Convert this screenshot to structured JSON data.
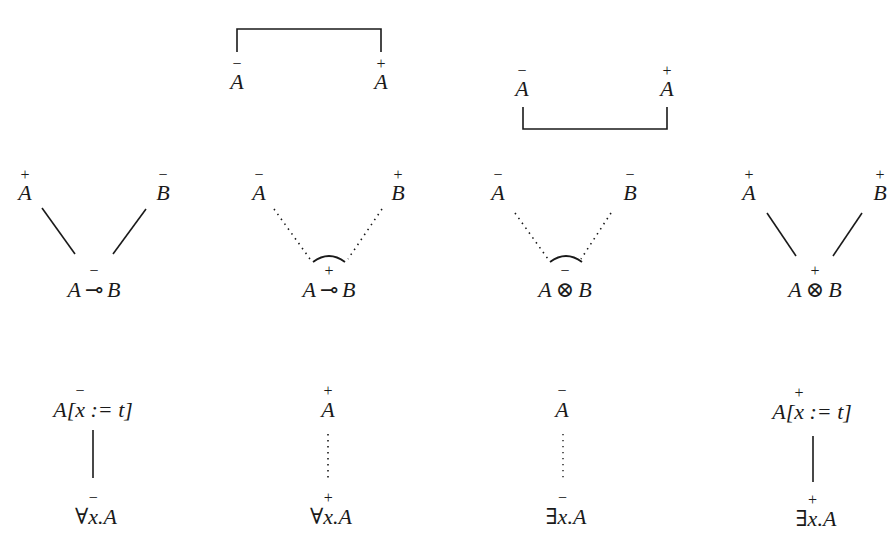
{
  "diagram": {
    "type": "proof-net-links",
    "axiom_links": [
      {
        "id": "axiom-top",
        "left": {
          "atom": "A",
          "polarity": "-"
        },
        "right": {
          "atom": "A",
          "polarity": "+"
        },
        "bracket": "above"
      },
      {
        "id": "axiom-bottom",
        "left": {
          "atom": "A",
          "polarity": "-"
        },
        "right": {
          "atom": "A",
          "polarity": "+"
        },
        "bracket": "below"
      }
    ],
    "binary_links": [
      {
        "id": "lollipop-neg",
        "premises": [
          {
            "atom": "A",
            "polarity": "+"
          },
          {
            "atom": "B",
            "polarity": "-"
          }
        ],
        "conclusion": {
          "left": "A",
          "op": "⊸",
          "right": "B",
          "polarity": "-"
        },
        "edge_style": "solid",
        "arc": false
      },
      {
        "id": "lollipop-pos",
        "premises": [
          {
            "atom": "A",
            "polarity": "-"
          },
          {
            "atom": "B",
            "polarity": "+"
          }
        ],
        "conclusion": {
          "left": "A",
          "op": "⊸",
          "right": "B",
          "polarity": "+"
        },
        "edge_style": "dotted",
        "arc": true
      },
      {
        "id": "tensor-neg",
        "premises": [
          {
            "atom": "A",
            "polarity": "-"
          },
          {
            "atom": "B",
            "polarity": "-"
          }
        ],
        "conclusion": {
          "left": "A",
          "op": "⊗",
          "right": "B",
          "polarity": "-"
        },
        "edge_style": "dotted",
        "arc": true
      },
      {
        "id": "tensor-pos",
        "premises": [
          {
            "atom": "A",
            "polarity": "+"
          },
          {
            "atom": "B",
            "polarity": "+"
          }
        ],
        "conclusion": {
          "left": "A",
          "op": "⊗",
          "right": "B",
          "polarity": "+"
        },
        "edge_style": "solid",
        "arc": false
      }
    ],
    "unary_links": [
      {
        "id": "forall-neg",
        "premise": {
          "pre": "A[",
          "var": "x",
          "post": " := t]",
          "polarity": "-"
        },
        "conclusion": {
          "quant": "∀",
          "var": "x",
          "body": ".A",
          "polarity": "-"
        },
        "edge_style": "solid"
      },
      {
        "id": "forall-pos",
        "premise": {
          "pre": "A",
          "polarity": "+"
        },
        "conclusion": {
          "quant": "∀",
          "var": "x",
          "body": ".A",
          "polarity": "+"
        },
        "edge_style": "dotted"
      },
      {
        "id": "exists-neg",
        "premise": {
          "pre": "A",
          "polarity": "-"
        },
        "conclusion": {
          "quant": "∃",
          "var": "x",
          "body": ".A",
          "polarity": "-"
        },
        "edge_style": "dotted"
      },
      {
        "id": "exists-pos",
        "premise": {
          "pre": "A[",
          "var": "x",
          "post": " := t]",
          "polarity": "+"
        },
        "conclusion": {
          "quant": "∃",
          "var": "x",
          "body": ".A",
          "polarity": "+"
        },
        "edge_style": "solid"
      }
    ],
    "colors": {
      "ink": "#1a1a1a",
      "background": "#ffffff"
    }
  }
}
